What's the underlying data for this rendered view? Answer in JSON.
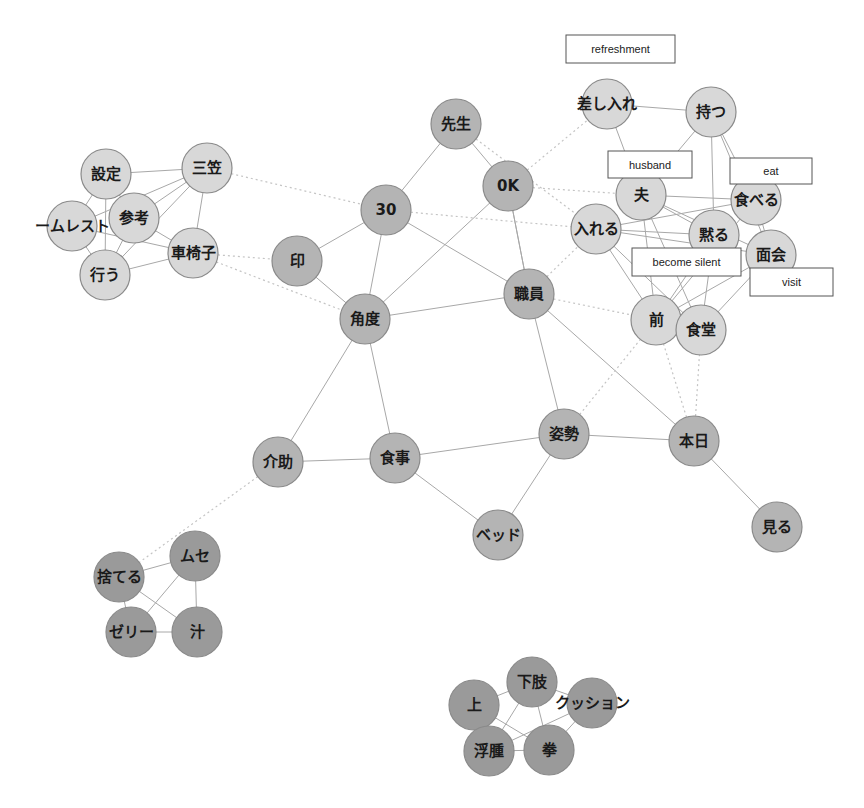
{
  "diagram": {
    "type": "co-occurrence network",
    "colors": {
      "light_node": "#d8d8d8",
      "medium_node": "#b4b4b4",
      "dark_node": "#9a9a9a",
      "edge": "#a8a8a8",
      "dotted_edge": "#c4c4c4"
    },
    "nodes": [
      {
        "id": "settei",
        "label": "設定",
        "x": 106,
        "y": 174,
        "r": 25,
        "shade": "light_node"
      },
      {
        "id": "mikasa",
        "label": "三笠",
        "x": 207,
        "y": 168,
        "r": 25,
        "shade": "light_node"
      },
      {
        "id": "sankou",
        "label": "参考",
        "x": 134,
        "y": 218,
        "r": 25,
        "shade": "light_node"
      },
      {
        "id": "homeless",
        "label": "ームレスト",
        "x": 72,
        "y": 226,
        "r": 25,
        "shade": "light_node"
      },
      {
        "id": "kurumaisu",
        "label": "車椅子",
        "x": 193,
        "y": 253,
        "r": 25,
        "shade": "light_node"
      },
      {
        "id": "okonau",
        "label": "行う",
        "x": 105,
        "y": 275,
        "r": 25,
        "shade": "light_node"
      },
      {
        "id": "sensei",
        "label": "先生",
        "x": 456,
        "y": 124,
        "r": 25,
        "shade": "medium_node"
      },
      {
        "id": "ok",
        "label": "0K",
        "x": 508,
        "y": 186,
        "r": 25,
        "shade": "medium_node"
      },
      {
        "id": "n30",
        "label": "30",
        "x": 386,
        "y": 210,
        "r": 25,
        "shade": "medium_node"
      },
      {
        "id": "in",
        "label": "印",
        "x": 297,
        "y": 261,
        "r": 25,
        "shade": "medium_node"
      },
      {
        "id": "shokuin",
        "label": "職員",
        "x": 529,
        "y": 294,
        "r": 25,
        "shade": "medium_node"
      },
      {
        "id": "kakudo",
        "label": "角度",
        "x": 365,
        "y": 319,
        "r": 25,
        "shade": "medium_node"
      },
      {
        "id": "shisei",
        "label": "姿勢",
        "x": 564,
        "y": 434,
        "r": 25,
        "shade": "medium_node"
      },
      {
        "id": "honjitsu",
        "label": "本日",
        "x": 694,
        "y": 441,
        "r": 25,
        "shade": "medium_node"
      },
      {
        "id": "kaijo",
        "label": "介助",
        "x": 278,
        "y": 462,
        "r": 25,
        "shade": "medium_node"
      },
      {
        "id": "shokuji",
        "label": "食事",
        "x": 395,
        "y": 458,
        "r": 25,
        "shade": "medium_node"
      },
      {
        "id": "bed",
        "label": "ベッド",
        "x": 498,
        "y": 535,
        "r": 25,
        "shade": "medium_node"
      },
      {
        "id": "miru",
        "label": "見る",
        "x": 777,
        "y": 527,
        "r": 25,
        "shade": "medium_node"
      },
      {
        "id": "sashiire",
        "label": "差し入れ",
        "x": 607,
        "y": 104,
        "r": 25,
        "shade": "light_node"
      },
      {
        "id": "motsu",
        "label": "持つ",
        "x": 711,
        "y": 112,
        "r": 25,
        "shade": "light_node"
      },
      {
        "id": "otto",
        "label": "夫",
        "x": 641,
        "y": 195,
        "r": 25,
        "shade": "light_node"
      },
      {
        "id": "taberu",
        "label": "食べる",
        "x": 756,
        "y": 200,
        "r": 25,
        "shade": "light_node"
      },
      {
        "id": "ireru",
        "label": "入れる",
        "x": 596,
        "y": 229,
        "r": 25,
        "shade": "light_node"
      },
      {
        "id": "damaru",
        "label": "黙る",
        "x": 714,
        "y": 235,
        "r": 25,
        "shade": "light_node"
      },
      {
        "id": "menkai",
        "label": "面会",
        "x": 771,
        "y": 255,
        "r": 25,
        "shade": "light_node"
      },
      {
        "id": "mae",
        "label": "前",
        "x": 656,
        "y": 320,
        "r": 25,
        "shade": "light_node"
      },
      {
        "id": "shokudou",
        "label": "食堂",
        "x": 701,
        "y": 330,
        "r": 25,
        "shade": "light_node"
      },
      {
        "id": "suteru",
        "label": "捨てる",
        "x": 119,
        "y": 577,
        "r": 25,
        "shade": "dark_node"
      },
      {
        "id": "muse",
        "label": "ムセ",
        "x": 195,
        "y": 556,
        "r": 25,
        "shade": "dark_node"
      },
      {
        "id": "jelly",
        "label": "ゼリー",
        "x": 131,
        "y": 632,
        "r": 25,
        "shade": "dark_node"
      },
      {
        "id": "shiru",
        "label": "汁",
        "x": 197,
        "y": 632,
        "r": 25,
        "shade": "dark_node"
      },
      {
        "id": "ue",
        "label": "上",
        "x": 474,
        "y": 705,
        "r": 25,
        "shade": "dark_node"
      },
      {
        "id": "kashi",
        "label": "下肢",
        "x": 532,
        "y": 682,
        "r": 25,
        "shade": "dark_node"
      },
      {
        "id": "cushion",
        "label": "クッション",
        "x": 592,
        "y": 703,
        "r": 25,
        "shade": "dark_node"
      },
      {
        "id": "fushu",
        "label": "浮腫",
        "x": 489,
        "y": 751,
        "r": 25,
        "shade": "dark_node"
      },
      {
        "id": "kobushi",
        "label": "拳",
        "x": 549,
        "y": 750,
        "r": 25,
        "shade": "dark_node"
      }
    ],
    "edges": [
      {
        "from": "settei",
        "to": "mikasa",
        "style": "solid"
      },
      {
        "from": "settei",
        "to": "homeless",
        "style": "solid"
      },
      {
        "from": "settei",
        "to": "okonau",
        "style": "solid"
      },
      {
        "from": "settei",
        "to": "sankou",
        "style": "solid"
      },
      {
        "from": "mikasa",
        "to": "sankou",
        "style": "solid"
      },
      {
        "from": "mikasa",
        "to": "homeless",
        "style": "solid"
      },
      {
        "from": "mikasa",
        "to": "kurumaisu",
        "style": "solid"
      },
      {
        "from": "mikasa",
        "to": "okonau",
        "style": "solid"
      },
      {
        "from": "sankou",
        "to": "kurumaisu",
        "style": "solid"
      },
      {
        "from": "homeless",
        "to": "kurumaisu",
        "style": "solid"
      },
      {
        "from": "homeless",
        "to": "okonau",
        "style": "solid"
      },
      {
        "from": "okonau",
        "to": "kurumaisu",
        "style": "solid"
      },
      {
        "from": "sankou",
        "to": "okonau",
        "style": "solid"
      },
      {
        "from": "mikasa",
        "to": "n30",
        "style": "dotted"
      },
      {
        "from": "kurumaisu",
        "to": "in",
        "style": "dotted"
      },
      {
        "from": "kurumaisu",
        "to": "kakudo",
        "style": "dotted"
      },
      {
        "from": "sensei",
        "to": "n30",
        "style": "solid"
      },
      {
        "from": "sensei",
        "to": "ok",
        "style": "solid"
      },
      {
        "from": "n30",
        "to": "in",
        "style": "solid"
      },
      {
        "from": "n30",
        "to": "kakudo",
        "style": "solid"
      },
      {
        "from": "n30",
        "to": "shokuin",
        "style": "solid"
      },
      {
        "from": "in",
        "to": "kakudo",
        "style": "solid"
      },
      {
        "from": "ok",
        "to": "kakudo",
        "style": "solid"
      },
      {
        "from": "ok",
        "to": "shokuin",
        "style": "solid"
      },
      {
        "from": "ok",
        "to": "shokuin",
        "style": "solid"
      },
      {
        "from": "kakudo",
        "to": "shokuin",
        "style": "solid"
      },
      {
        "from": "kakudo",
        "to": "kaijo",
        "style": "solid"
      },
      {
        "from": "kakudo",
        "to": "shokuji",
        "style": "solid"
      },
      {
        "from": "shokuin",
        "to": "shisei",
        "style": "solid"
      },
      {
        "from": "shokuin",
        "to": "honjitsu",
        "style": "solid"
      },
      {
        "from": "kaijo",
        "to": "shokuji",
        "style": "solid"
      },
      {
        "from": "shokuji",
        "to": "shisei",
        "style": "solid"
      },
      {
        "from": "shokuji",
        "to": "bed",
        "style": "solid"
      },
      {
        "from": "shisei",
        "to": "bed",
        "style": "solid"
      },
      {
        "from": "shisei",
        "to": "honjitsu",
        "style": "solid"
      },
      {
        "from": "honjitsu",
        "to": "miru",
        "style": "solid"
      },
      {
        "from": "n30",
        "to": "ireru",
        "style": "dotted"
      },
      {
        "from": "ok",
        "to": "sashiire",
        "style": "dotted"
      },
      {
        "from": "ok",
        "to": "otto",
        "style": "dotted"
      },
      {
        "from": "sensei",
        "to": "ireru",
        "style": "dotted"
      },
      {
        "from": "shokuin",
        "to": "ireru",
        "style": "dotted"
      },
      {
        "from": "shokuin",
        "to": "mae",
        "style": "dotted"
      },
      {
        "from": "shisei",
        "to": "mae",
        "style": "dotted"
      },
      {
        "from": "honjitsu",
        "to": "mae",
        "style": "dotted"
      },
      {
        "from": "honjitsu",
        "to": "shokudou",
        "style": "dotted"
      },
      {
        "from": "kaijo",
        "to": "suteru",
        "style": "dotted"
      },
      {
        "from": "sashiire",
        "to": "motsu",
        "style": "solid"
      },
      {
        "from": "sashiire",
        "to": "otto",
        "style": "solid"
      },
      {
        "from": "motsu",
        "to": "otto",
        "style": "solid"
      },
      {
        "from": "motsu",
        "to": "damaru",
        "style": "solid"
      },
      {
        "from": "motsu",
        "to": "taberu",
        "style": "solid"
      },
      {
        "from": "motsu",
        "to": "menkai",
        "style": "solid"
      },
      {
        "from": "otto",
        "to": "taberu",
        "style": "solid"
      },
      {
        "from": "otto",
        "to": "damaru",
        "style": "solid"
      },
      {
        "from": "otto",
        "to": "menkai",
        "style": "solid"
      },
      {
        "from": "otto",
        "to": "mae",
        "style": "solid"
      },
      {
        "from": "otto",
        "to": "shokudou",
        "style": "solid"
      },
      {
        "from": "ireru",
        "to": "taberu",
        "style": "solid"
      },
      {
        "from": "ireru",
        "to": "damaru",
        "style": "solid"
      },
      {
        "from": "ireru",
        "to": "menkai",
        "style": "solid"
      },
      {
        "from": "ireru",
        "to": "mae",
        "style": "solid"
      },
      {
        "from": "ireru",
        "to": "shokudou",
        "style": "solid"
      },
      {
        "from": "taberu",
        "to": "menkai",
        "style": "solid"
      },
      {
        "from": "taberu",
        "to": "mae",
        "style": "solid"
      },
      {
        "from": "damaru",
        "to": "mae",
        "style": "solid"
      },
      {
        "from": "damaru",
        "to": "shokudou",
        "style": "solid"
      },
      {
        "from": "menkai",
        "to": "mae",
        "style": "solid"
      },
      {
        "from": "menkai",
        "to": "shokudou",
        "style": "solid"
      },
      {
        "from": "mae",
        "to": "shokudou",
        "style": "solid"
      },
      {
        "from": "suteru",
        "to": "muse",
        "style": "solid"
      },
      {
        "from": "suteru",
        "to": "jelly",
        "style": "solid"
      },
      {
        "from": "suteru",
        "to": "shiru",
        "style": "solid"
      },
      {
        "from": "muse",
        "to": "jelly",
        "style": "solid"
      },
      {
        "from": "muse",
        "to": "shiru",
        "style": "solid"
      },
      {
        "from": "jelly",
        "to": "shiru",
        "style": "solid"
      },
      {
        "from": "ue",
        "to": "kashi",
        "style": "solid"
      },
      {
        "from": "ue",
        "to": "kobushi",
        "style": "solid"
      },
      {
        "from": "kashi",
        "to": "cushion",
        "style": "solid"
      },
      {
        "from": "kashi",
        "to": "fushu",
        "style": "solid"
      },
      {
        "from": "kashi",
        "to": "kobushi",
        "style": "solid"
      },
      {
        "from": "cushion",
        "to": "fushu",
        "style": "solid"
      },
      {
        "from": "cushion",
        "to": "kobushi",
        "style": "solid"
      },
      {
        "from": "fushu",
        "to": "kobushi",
        "style": "solid"
      }
    ],
    "translation_tags": [
      {
        "id": "tag-refreshment",
        "text": "refreshment",
        "x": 566,
        "y": 35,
        "w": 109,
        "h": 28
      },
      {
        "id": "tag-husband",
        "text": "husband",
        "x": 608,
        "y": 151,
        "w": 84,
        "h": 27
      },
      {
        "id": "tag-eat",
        "text": "eat",
        "x": 730,
        "y": 158,
        "w": 82,
        "h": 26
      },
      {
        "id": "tag-become-silent",
        "text": "become silent",
        "x": 632,
        "y": 248,
        "w": 109,
        "h": 28
      },
      {
        "id": "tag-visit",
        "text": "visit",
        "x": 750,
        "y": 268,
        "w": 83,
        "h": 28
      }
    ]
  }
}
